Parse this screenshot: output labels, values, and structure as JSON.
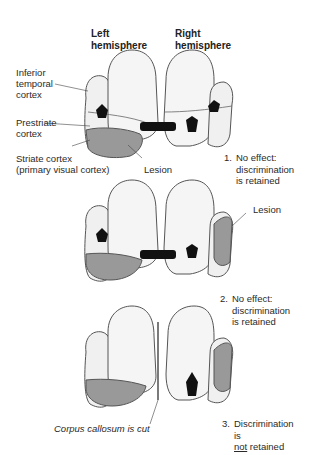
{
  "headers": {
    "left": "Left\nhemisphere",
    "right": "Right\nhemisphere"
  },
  "panel1": {
    "labels": {
      "inferior_temporal": "Inferior\ntemporal\ncortex",
      "prestriate": "Prestriate\ncortex",
      "striate": "Striate cortex\n(primary visual cortex)",
      "lesion": "Lesion"
    },
    "result_number": "1.",
    "result_text": "No effect:\ndiscrimination\nis retained"
  },
  "panel2": {
    "labels": {
      "lesion": "Lesion"
    },
    "result_number": "2.",
    "result_text": "No effect:\ndiscrimination\nis retained"
  },
  "panel3": {
    "labels": {
      "corpus_callosum": "Corpus callosum is cut"
    },
    "result_number": "3.",
    "result_text_line1": "Discrimination is",
    "result_text_not": "not",
    "result_text_rest": " retained"
  },
  "colors": {
    "brain_fill": "#f2f2f2",
    "brain_stroke": "#555555",
    "lesion_fill": "#9a9a9a",
    "arrow_fill": "#111111"
  }
}
